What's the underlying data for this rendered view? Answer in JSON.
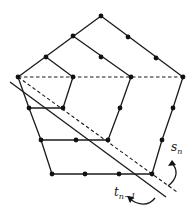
{
  "diagram": {
    "labels": {
      "s_main": "s",
      "s_sub": "n",
      "t_main": "t",
      "t_sub": "n−1"
    },
    "colors": {
      "line": "#1a1a1a",
      "node": "#111111",
      "background": "#ffffff"
    },
    "nodes": [
      [
        101,
        16
      ],
      [
        73,
        36
      ],
      [
        128,
        37
      ],
      [
        46,
        57
      ],
      [
        101,
        57
      ],
      [
        156,
        58
      ],
      [
        18,
        77
      ],
      [
        73,
        77
      ],
      [
        131,
        77
      ],
      [
        183,
        77
      ],
      [
        29,
        108
      ],
      [
        63,
        108
      ],
      [
        120,
        108
      ],
      [
        173,
        108
      ],
      [
        41,
        140
      ],
      [
        76,
        140
      ],
      [
        108,
        140
      ],
      [
        162,
        140
      ],
      [
        52,
        174
      ],
      [
        85,
        174
      ],
      [
        119,
        174
      ],
      [
        152,
        174
      ]
    ]
  }
}
